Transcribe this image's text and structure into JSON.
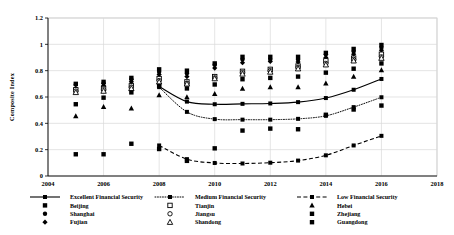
{
  "chart_data": {
    "type": "scatter",
    "title": "",
    "xlabel": "",
    "ylabel": "Composite Index",
    "xlim": [
      2004,
      2018
    ],
    "ylim": [
      0,
      1.2
    ],
    "xticks": [
      "2004",
      "2006",
      "2008",
      "2010",
      "2012",
      "2014",
      "2016",
      "2018"
    ],
    "yticks": [
      "0",
      "0.2",
      "0.4",
      "0.6",
      "0.8",
      "1",
      "1.2"
    ],
    "grid": true,
    "legend_position": "bottom",
    "x": [
      2005,
      2006,
      2007,
      2008,
      2009,
      2010,
      2011,
      2012,
      2013,
      2014,
      2015,
      2016
    ],
    "trend_series": [
      {
        "name": "Excellent Financial Security",
        "style": "solid",
        "marker": "filled-square",
        "x": [
          2008,
          2009,
          2010,
          2011,
          2012,
          2013,
          2014,
          2015,
          2016
        ],
        "values": [
          0.68,
          0.565,
          0.545,
          0.548,
          0.551,
          0.561,
          0.592,
          0.655,
          0.737
        ]
      },
      {
        "name": "Medium Financial Security",
        "style": "dotted",
        "marker": "filled-square",
        "x": [
          2008,
          2009,
          2010,
          2011,
          2012,
          2013,
          2014,
          2015,
          2016
        ],
        "values": [
          0.675,
          0.487,
          0.432,
          0.428,
          0.428,
          0.434,
          0.457,
          0.523,
          0.598
        ]
      },
      {
        "name": "Low Financial Security",
        "style": "dashed",
        "marker": "filled-square",
        "x": [
          2008,
          2009,
          2010,
          2011,
          2012,
          2013,
          2014,
          2015,
          2016
        ],
        "values": [
          0.232,
          0.128,
          0.099,
          0.095,
          0.101,
          0.117,
          0.157,
          0.232,
          0.305
        ]
      }
    ],
    "point_series": [
      {
        "name": "Beijing",
        "marker": "filled-square",
        "values": [
          0.7,
          0.715,
          0.745,
          0.81,
          0.8,
          0.855,
          0.905,
          0.905,
          0.905,
          0.935,
          0.965,
          0.995
        ]
      },
      {
        "name": "Shanghai",
        "marker": "filled-circle",
        "values": [
          0.695,
          0.705,
          0.735,
          0.79,
          0.78,
          0.845,
          0.885,
          0.885,
          0.885,
          0.925,
          0.945,
          0.975
        ]
      },
      {
        "name": "Fujian",
        "marker": "filled-diamond",
        "values": [
          0.665,
          0.685,
          0.715,
          0.77,
          0.755,
          0.82,
          0.86,
          0.87,
          0.865,
          0.9,
          0.925,
          0.955
        ]
      },
      {
        "name": "Tianjin",
        "marker": "open-square",
        "values": [
          0.655,
          0.665,
          0.685,
          0.74,
          0.715,
          0.755,
          0.795,
          0.81,
          0.835,
          0.875,
          0.895,
          0.925
        ]
      },
      {
        "name": "Jiangsu",
        "marker": "open-circle",
        "values": [
          0.645,
          0.655,
          0.675,
          0.725,
          0.705,
          0.745,
          0.785,
          0.8,
          0.825,
          0.855,
          0.885,
          0.905
        ]
      },
      {
        "name": "Shandong",
        "marker": "open-triangle",
        "values": [
          0.635,
          0.645,
          0.665,
          0.715,
          0.7,
          0.74,
          0.775,
          0.79,
          0.815,
          0.845,
          0.875,
          0.895
        ]
      },
      {
        "name": "Hebei",
        "marker": "filled-triangle",
        "values": [
          0.455,
          0.525,
          0.515,
          0.615,
          0.6,
          0.625,
          0.665,
          0.675,
          0.675,
          0.705,
          0.755,
          0.805
        ]
      },
      {
        "name": "Zhejiang",
        "marker": "filled-square",
        "values": [
          0.545,
          0.595,
          0.635,
          0.685,
          0.665,
          0.695,
          0.735,
          0.745,
          0.755,
          0.785,
          0.815,
          0.855
        ]
      },
      {
        "name": "Guangdong",
        "marker": "filled-square",
        "values": [
          0.165,
          0.165,
          0.245,
          0.205,
          0.115,
          0.21,
          0.345,
          0.36,
          0.355,
          0.465,
          0.505,
          0.535
        ]
      }
    ]
  },
  "legend": {
    "columns": [
      {
        "series_label": "Excellent Financial Security",
        "series_style": "solid",
        "items": [
          {
            "label": "Beijing",
            "marker": "filled-square"
          },
          {
            "label": "Shanghai",
            "marker": "filled-circle"
          },
          {
            "label": "Fujian",
            "marker": "filled-diamond"
          }
        ]
      },
      {
        "series_label": "Medium Financial Security",
        "series_style": "dotted",
        "items": [
          {
            "label": "Tianjin",
            "marker": "open-square"
          },
          {
            "label": "Jiangsu",
            "marker": "open-circle"
          },
          {
            "label": "Shandong",
            "marker": "open-triangle"
          }
        ]
      },
      {
        "series_label": "Low Financial Security",
        "series_style": "dashed",
        "items": [
          {
            "label": "Hebei",
            "marker": "filled-triangle"
          },
          {
            "label": "Zhejiang",
            "marker": "filled-square"
          },
          {
            "label": "Guangdong",
            "marker": "filled-square"
          }
        ]
      }
    ]
  },
  "colors": {
    "axis": "#000000",
    "grid": "#d9d9d9",
    "marker": "#000000",
    "plot_border": "#bfbfbf"
  }
}
